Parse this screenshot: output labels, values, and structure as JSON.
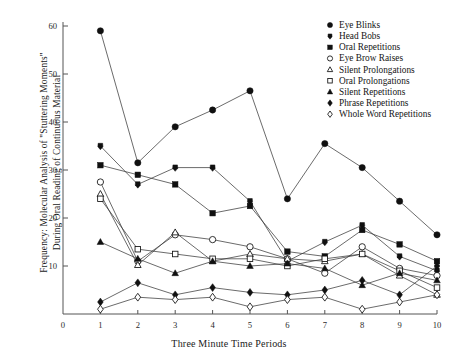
{
  "figure": {
    "ylabel_line1": "Frequency:  Molecular Analysis of  \"Stuttering Moments\"",
    "ylabel_line2": "During Oral Reading of Continuous Material",
    "xlabel": "Three Minute Time Periods"
  },
  "chart_data": {
    "type": "line",
    "title": "",
    "xlabel": "Three Minute Time Periods",
    "ylabel": "Frequency:  Molecular Analysis of \"Stuttering Moments\" During Oral Reading of Continuous Material",
    "x": [
      1,
      2,
      3,
      4,
      5,
      6,
      7,
      8,
      9,
      10
    ],
    "xticks": [
      0,
      1,
      2,
      3,
      4,
      5,
      6,
      7,
      8,
      9,
      10
    ],
    "yticks": [
      0,
      10,
      20,
      30,
      40,
      50,
      60
    ],
    "xlim": [
      0,
      10
    ],
    "ylim": [
      0,
      62
    ],
    "grid": false,
    "legend_position": "top-right",
    "series": [
      {
        "name": "Eye Blinks",
        "marker": "filled-circle",
        "values": [
          59,
          31.5,
          39,
          42.5,
          46.5,
          24,
          35.5,
          30.5,
          23.5,
          16.5
        ]
      },
      {
        "name": "Head Bobs",
        "marker": "filled-hexagon",
        "values": [
          35,
          27,
          30.5,
          30.5,
          23.5,
          11,
          15,
          18.5,
          12,
          9
        ]
      },
      {
        "name": "Oral Repetitions",
        "marker": "filled-square",
        "values": [
          31,
          29,
          27,
          21,
          22.5,
          13,
          12,
          17.5,
          14.5,
          11
        ]
      },
      {
        "name": "Eye Brow Raises",
        "marker": "open-circle",
        "values": [
          27.5,
          11,
          16.5,
          15.5,
          14,
          11.5,
          8.5,
          14,
          9.5,
          8
        ]
      },
      {
        "name": "Silent Prolongations",
        "marker": "open-triangle",
        "values": [
          25,
          10.2,
          17,
          11,
          12.5,
          11.5,
          11,
          12.5,
          8,
          4
        ]
      },
      {
        "name": "Oral Prolongations",
        "marker": "open-square",
        "values": [
          24,
          13.5,
          12.5,
          11.5,
          11.5,
          10,
          11.5,
          12.5,
          9,
          5.5
        ]
      },
      {
        "name": "Silent Repetitions",
        "marker": "filled-triangle",
        "values": [
          15,
          11.5,
          8.5,
          11,
          10,
          10.5,
          9.5,
          6,
          8.5,
          7
        ]
      },
      {
        "name": "Phrase Repetitions",
        "marker": "filled-diamond",
        "values": [
          2.5,
          6.5,
          4,
          5.5,
          4.5,
          4,
          5,
          7,
          4,
          10
        ]
      },
      {
        "name": "Whole Word Repetitions",
        "marker": "open-diamond",
        "values": [
          1,
          3.5,
          3,
          3.5,
          1.5,
          3,
          3.5,
          1,
          2.5,
          4
        ]
      }
    ]
  }
}
